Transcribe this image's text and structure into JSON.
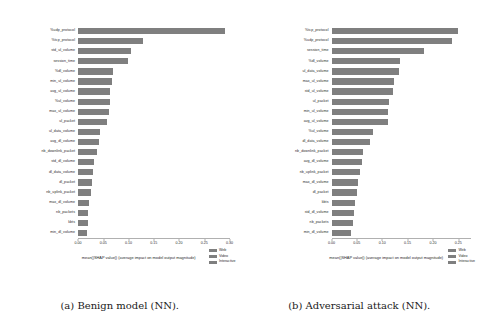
{
  "figure": {
    "background": "#ffffff",
    "bar_color": "#7f7f7f",
    "axis_color": "#b0b0b0"
  },
  "captions": {
    "left": "(a) Benign model (NN).",
    "right": "(b) Adversarial attack (NN)."
  },
  "legend": {
    "items": [
      {
        "label": "Web",
        "color": "#7f7f7f"
      },
      {
        "label": "Video",
        "color": "#7f7f7f"
      },
      {
        "label": "Interactive",
        "color": "#7f7f7f"
      }
    ]
  },
  "chart_data": [
    {
      "type": "bar",
      "orientation": "horizontal",
      "panel": "a",
      "title": "(a) Benign model (NN).",
      "xlabel": "mean(|SHAP value|) (average impact on model output magnitude)",
      "ylabel": "",
      "xlim": [
        0.0,
        0.3
      ],
      "xticks": [
        0.0,
        0.05,
        0.1,
        0.15,
        0.2,
        0.25,
        0.3
      ],
      "xticklabels": [
        "0.00",
        "0.05",
        "0.10",
        "0.15",
        "0.20",
        "0.25",
        "0.30"
      ],
      "grid": false,
      "legend_position": "lower right",
      "legend_entries": [
        "Web",
        "Video",
        "Interactive"
      ],
      "categories": [
        "%udp_protocol",
        "%tcp_protocol",
        "std_ul_volume",
        "session_time",
        "%dl_volume",
        "min_ul_volume",
        "avg_ul_volume",
        "%ul_volume",
        "max_ul_volume",
        "ul_packet",
        "ul_data_volume",
        "avg_dl_volume",
        "nb_downlink_packet",
        "std_dl_volume",
        "dl_data_volume",
        "dl_packet",
        "nb_uplink_packet",
        "max_dl_volume",
        "nb_packets",
        "kbts",
        "min_dl_volume"
      ],
      "values": [
        0.292,
        0.128,
        0.104,
        0.099,
        0.07,
        0.068,
        0.064,
        0.063,
        0.061,
        0.058,
        0.043,
        0.042,
        0.038,
        0.031,
        0.03,
        0.028,
        0.026,
        0.022,
        0.02,
        0.019,
        0.018
      ]
    },
    {
      "type": "bar",
      "orientation": "horizontal",
      "panel": "b",
      "title": "(b) Adversarial attack (NN).",
      "xlabel": "mean(|SHAP value|) (average impact on model output magnitude)",
      "ylabel": "",
      "xlim": [
        0.0,
        0.275
      ],
      "xticks": [
        0.0,
        0.05,
        0.1,
        0.15,
        0.2,
        0.25
      ],
      "xticklabels": [
        "0.00",
        "0.05",
        "0.10",
        "0.15",
        "0.20",
        "0.25"
      ],
      "grid": false,
      "legend_position": "lower right",
      "legend_entries": [
        "Web",
        "Video",
        "Interactive"
      ],
      "categories": [
        "%tcp_protocol",
        "%udp_protocol",
        "session_time",
        "%dl_volume",
        "ul_data_volume",
        "max_ul_volume",
        "std_ul_volume",
        "ul_packet",
        "min_ul_volume",
        "avg_ul_volume",
        "%ul_volume",
        "dl_data_volume",
        "nb_downlink_packet",
        "avg_dl_volume",
        "nb_uplink_packet",
        "max_dl_volume",
        "dl_packet",
        "kbts",
        "std_dl_volume",
        "nb_packets",
        "min_dl_volume"
      ],
      "values": [
        0.249,
        0.238,
        0.183,
        0.136,
        0.133,
        0.124,
        0.122,
        0.114,
        0.112,
        0.111,
        0.082,
        0.076,
        0.062,
        0.06,
        0.057,
        0.053,
        0.05,
        0.046,
        0.044,
        0.042,
        0.039
      ]
    }
  ]
}
